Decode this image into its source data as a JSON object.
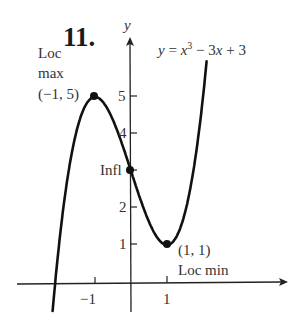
{
  "problem_number": "11.",
  "chart_data": {
    "type": "line",
    "function": "x^3 - 3x + 3",
    "xlabel": "",
    "ylabel": "y",
    "x_ticks": [
      -1,
      1
    ],
    "x_tick_labels": [
      "−1",
      "1"
    ],
    "y_ticks": [
      1,
      2,
      3,
      4,
      5
    ],
    "y_tick_labels": [
      "1",
      "2",
      "",
      "4",
      "5"
    ],
    "xlim": [
      -2.2,
      2.1
    ],
    "ylim": [
      -0.7,
      6.1
    ],
    "grid": false,
    "points": [
      {
        "x": -2.2,
        "y": -4.05
      },
      {
        "x": -2.0,
        "y": 1.0
      },
      {
        "x": -1.5,
        "y": 4.125
      },
      {
        "x": -1.0,
        "y": 5.0
      },
      {
        "x": -0.5,
        "y": 4.375
      },
      {
        "x": 0.0,
        "y": 3.0
      },
      {
        "x": 0.5,
        "y": 1.625
      },
      {
        "x": 1.0,
        "y": 1.0
      },
      {
        "x": 1.5,
        "y": 1.875
      },
      {
        "x": 2.0,
        "y": 5.0
      },
      {
        "x": 2.1,
        "y": 5.96
      }
    ],
    "annotations": [
      {
        "label": "Loc max",
        "coords": "(−1, 5)",
        "x": -1,
        "y": 5
      },
      {
        "label": "Infl",
        "x": 0,
        "y": 3
      },
      {
        "label": "Loc min",
        "coords": "(1, 1)",
        "x": 1,
        "y": 1
      }
    ]
  },
  "labels": {
    "y_axis": "y",
    "loc_max_line1": "Loc",
    "loc_max_line2": "max",
    "loc_max_coords": "(−1, 5)",
    "infl": "Infl",
    "loc_min_coords": "(1, 1)",
    "loc_min": "Loc min",
    "eq_y": "y",
    "eq_eq": " = ",
    "eq_x": "x",
    "eq_exp": "3",
    "eq_rest1": " − 3",
    "eq_x2": "x",
    "eq_rest2": " + 3"
  },
  "tick_labels": {
    "y5": "5",
    "y4": "4",
    "y2": "2",
    "y1": "1",
    "xm1": "−1",
    "x1": "1"
  }
}
